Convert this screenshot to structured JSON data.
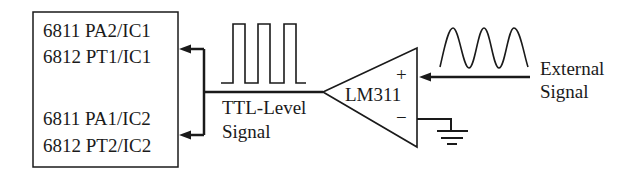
{
  "diagram": {
    "type": "circuit-block-diagram",
    "mcu_box": {
      "lines": [
        "6811 PA2/IC1",
        "6812 PT1/IC1",
        "6811 PA1/IC2",
        "6812 PT2/IC2"
      ]
    },
    "comparator": {
      "label": "LM311",
      "plus_symbol": "+",
      "minus_symbol": "−"
    },
    "output_signal": {
      "label_line1": "TTL-Level",
      "label_line2": "Signal",
      "waveform": "square-wave"
    },
    "input_signal": {
      "label_line1": "External",
      "label_line2": "Signal",
      "waveform": "sine-wave"
    },
    "ground": {
      "icon": "ground-symbol"
    },
    "colors": {
      "line": "#1a1a1a",
      "background": "#ffffff"
    }
  }
}
